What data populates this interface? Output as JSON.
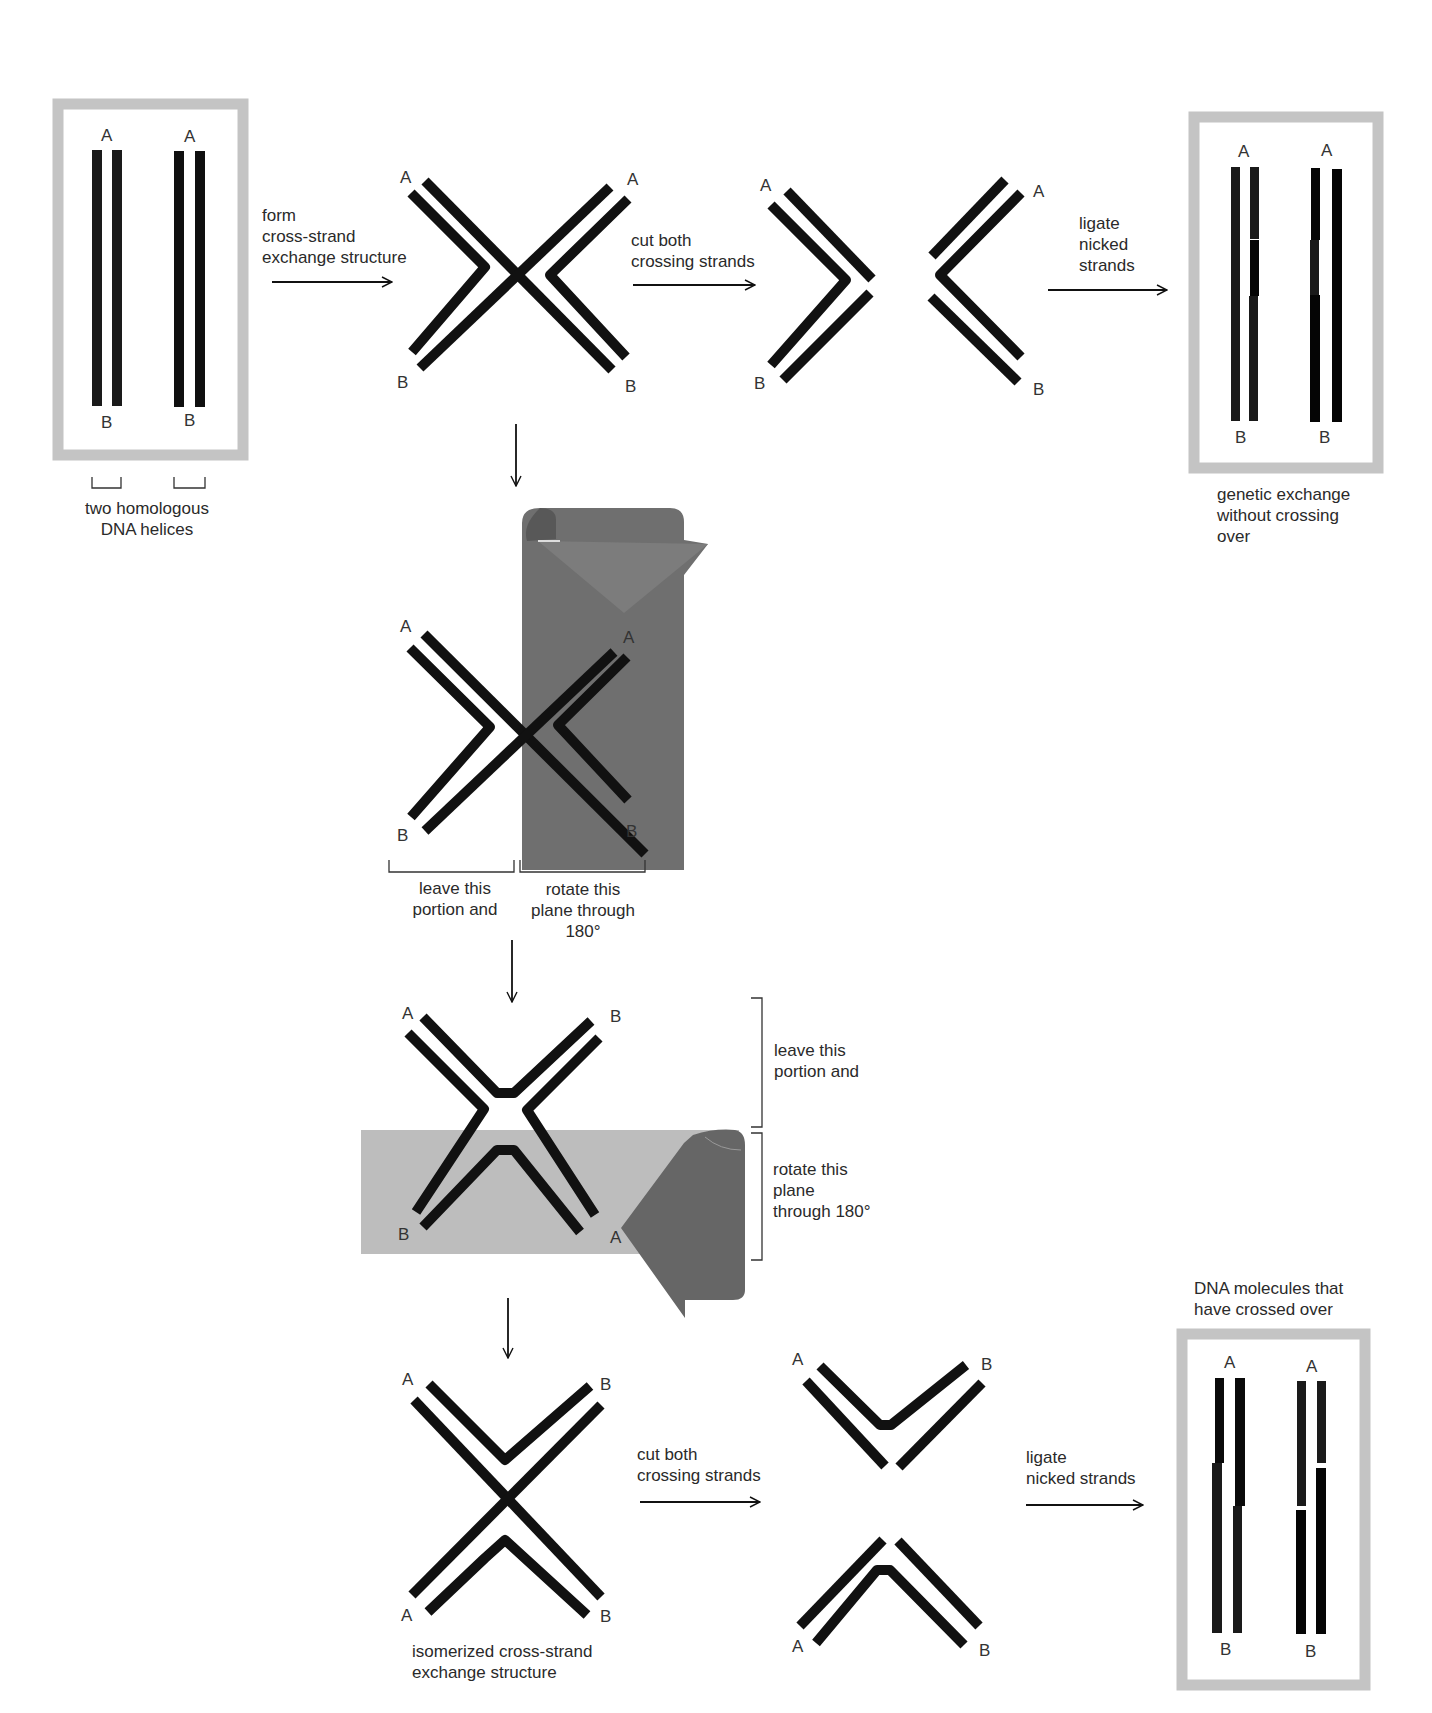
{
  "figure": {
    "stages": {
      "start": {
        "caption": "two homologous\nDNA helices",
        "ends": {
          "top": "A",
          "bottom": "B"
        }
      },
      "step1": {
        "label": "form\ncross-strand\nexchange structure"
      },
      "cross1": {
        "ends": {
          "tl": "A",
          "tr": "A",
          "bl": "B",
          "br": "B"
        }
      },
      "step2": {
        "label": "cut both\ncrossing strands"
      },
      "cut1": {
        "ends": {
          "tl": "A",
          "tr": "A",
          "bl": "B",
          "br": "B"
        }
      },
      "step3": {
        "label": "ligate\nnicked\nstrands"
      },
      "result1": {
        "caption": "genetic exchange\nwithout crossing\nover",
        "ends": {
          "top": "A",
          "bottom": "B"
        }
      },
      "rotate1": {
        "ends": {
          "tl": "A",
          "tr": "A",
          "bl": "B",
          "br": "B"
        },
        "left_caption": "leave this\nportion and",
        "right_caption": "rotate this\nplane through\n180°"
      },
      "rotate2": {
        "ends": {
          "tl": "A",
          "tr": "B",
          "bl": "B",
          "br": "A"
        },
        "top_caption": "leave this\nportion and",
        "bottom_caption": "rotate this\nplane\nthrough 180°"
      },
      "isomer": {
        "ends": {
          "tl": "A",
          "tr": "B",
          "bl": "A",
          "br": "B"
        },
        "caption": "isomerized cross-strand\nexchange structure"
      },
      "step4": {
        "label": "cut both\ncrossing strands"
      },
      "cut2": {
        "ends": {
          "tl": "A",
          "tr": "B",
          "bl": "A",
          "br": "B"
        }
      },
      "step5": {
        "label": "ligate\nnicked strands"
      },
      "result2": {
        "caption": "DNA molecules that\nhave crossed over",
        "ends": {
          "top": "A",
          "bottom": "B"
        }
      }
    },
    "colors": {
      "strand": "#111111",
      "frame": "#c4c4c4",
      "dark_plane": "#6e6e6e",
      "light_plane": "#bdbdbd",
      "arrow_plane_dark": "#666666"
    }
  }
}
